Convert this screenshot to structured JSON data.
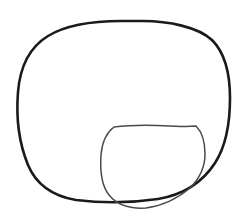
{
  "canvas": {
    "width": 244,
    "height": 216,
    "background_color": "#ffffff",
    "title": "hand-drawn line sketch"
  },
  "drawing": {
    "style": "black ink contour line drawing on white background",
    "stroke_color": "#1a1a1a",
    "inner_stroke_color": "#4a4a4a",
    "shapes": [
      {
        "name": "outer-contour",
        "description": "large rounded square / blob outline occupying most of the frame",
        "stroke_color": "#1a1a1a",
        "stroke_width": 2.6,
        "closed": true,
        "bounds": {
          "x": 17,
          "y": 20,
          "width": 214,
          "height": 183
        },
        "path": "M 121 21 C 95 21 66 25 48 36 C 30 47 20 67 18 92 C 16 117 19 143 28 165 C 36 184 52 196 76 200 C 100 203 131 203 158 199 C 182 195 202 183 215 163 C 226 146 230 120 230 98 C 230 74 225 53 212 40 C 198 27 168 21 143 21 Z"
      },
      {
        "name": "inner-contour",
        "description": "smaller rounded shape at the lower center, overlapping the bottom-right of the outer contour",
        "stroke_color": "#4a4a4a",
        "stroke_width": 1.5,
        "closed": true,
        "bounds": {
          "x": 100,
          "y": 125,
          "width": 106,
          "height": 84
        },
        "path": "M 114 127 C 130 125 152 125 170 126 C 182 127 191 126 196 126 C 202 132 205 143 205 154 C 205 166 200 178 190 188 C 178 198 162 206 146 208 C 130 209 117 205 109 195 C 101 185 100 170 101 155 C 102 143 106 133 114 127 Z"
      }
    ]
  },
  "annotations": {
    "shape_count": 2,
    "colors_used": [
      "#1a1a1a",
      "#4a4a4a",
      "#ffffff"
    ]
  }
}
